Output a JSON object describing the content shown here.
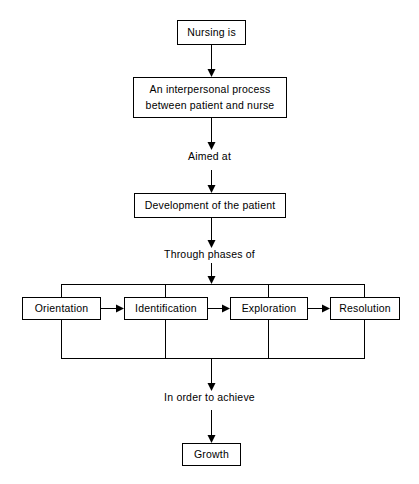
{
  "diagram": {
    "title": "Nursing is an interpersonal process",
    "line_color": "#000000",
    "background_color": "#ffffff",
    "nodes": {
      "nursing_is": "Nursing is",
      "interpersonal_process": "An interpersonal process\nbetween patient and nurse",
      "development": "Development of the patient",
      "growth": "Growth"
    },
    "captions": {
      "aimed_at": "Aimed at",
      "through_phases_of": "Through phases of",
      "in_order_to_achieve": "In order to achieve"
    },
    "phases": [
      {
        "label": "Orientation"
      },
      {
        "label": "Identification"
      },
      {
        "label": "Exploration"
      },
      {
        "label": "Resolution"
      }
    ]
  }
}
